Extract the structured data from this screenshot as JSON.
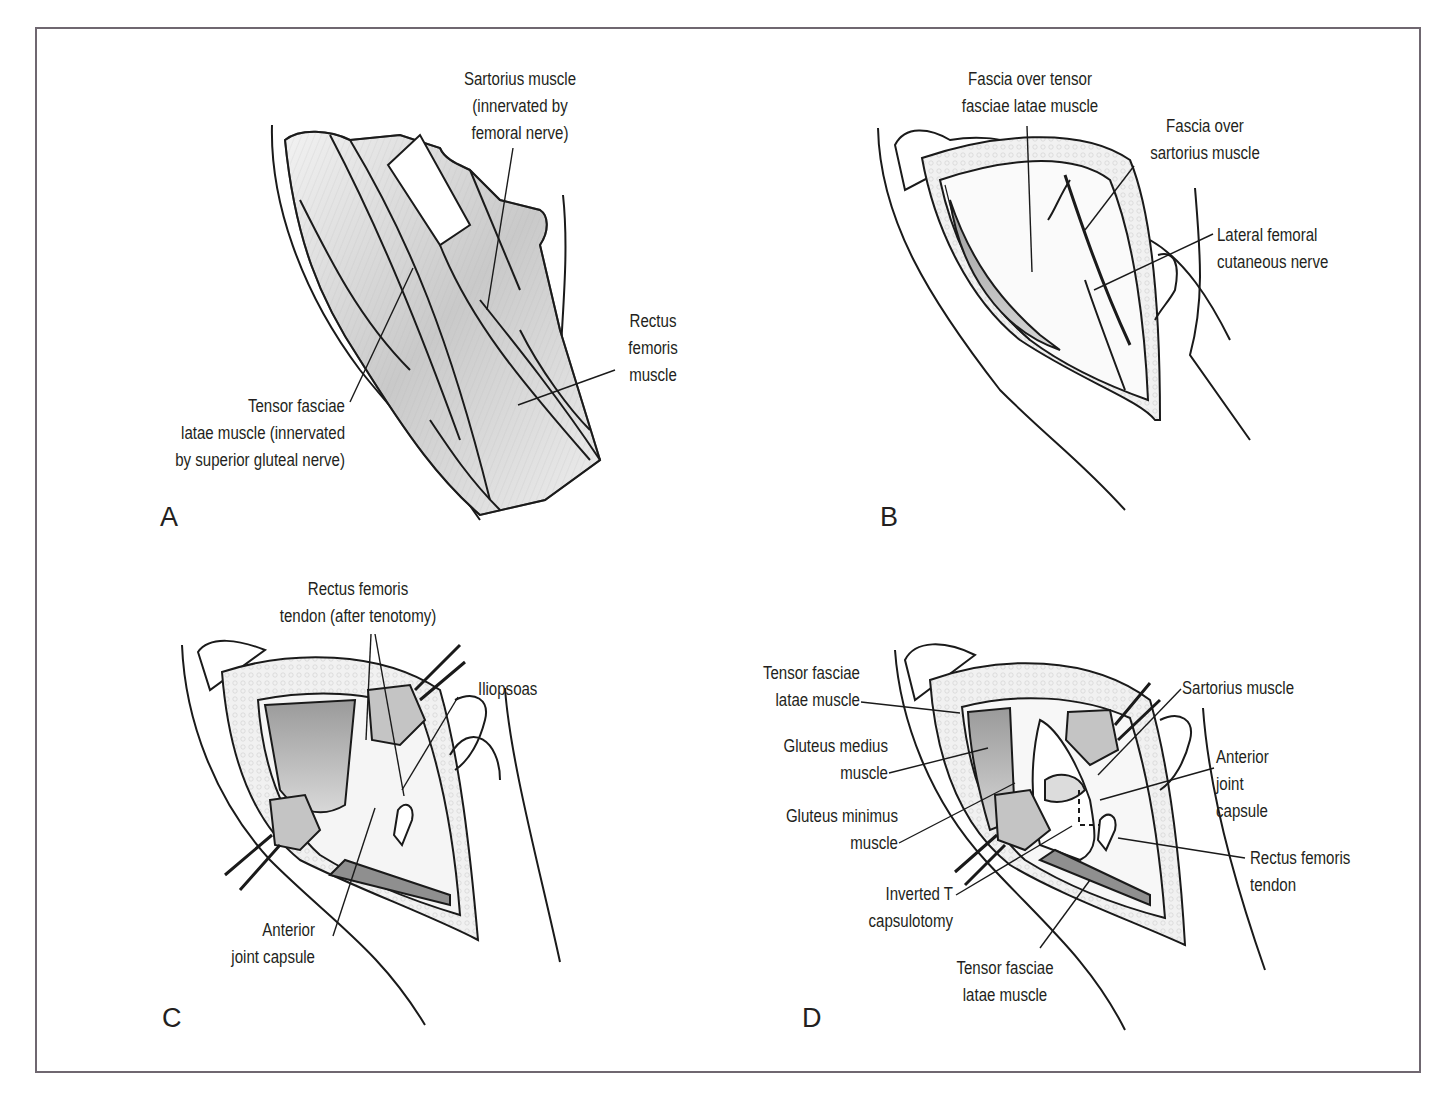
{
  "figure": {
    "panels": [
      {
        "id": "A",
        "label": "A",
        "callouts": [
          {
            "lines": [
              "Sartorius muscle",
              "(innervated by",
              "femoral nerve)"
            ]
          },
          {
            "lines": [
              "Rectus",
              "femoris",
              "muscle"
            ]
          },
          {
            "lines": [
              "Tensor fasciae",
              "latae muscle (innervated",
              "by superior gluteal nerve)"
            ]
          }
        ]
      },
      {
        "id": "B",
        "label": "B",
        "callouts": [
          {
            "lines": [
              "Fascia over tensor",
              "fasciae latae muscle"
            ]
          },
          {
            "lines": [
              "Fascia over",
              "sartorius muscle"
            ]
          },
          {
            "lines": [
              "Lateral femoral",
              "cutaneous nerve"
            ]
          }
        ]
      },
      {
        "id": "C",
        "label": "C",
        "callouts": [
          {
            "lines": [
              "Rectus femoris",
              "tendon (after tenotomy)"
            ]
          },
          {
            "lines": [
              "Iliopsoas"
            ]
          },
          {
            "lines": [
              "Anterior",
              "joint capsule"
            ]
          }
        ]
      },
      {
        "id": "D",
        "label": "D",
        "callouts": [
          {
            "lines": [
              "Tensor fasciae",
              "latae muscle"
            ]
          },
          {
            "lines": [
              "Gluteus medius",
              "muscle"
            ]
          },
          {
            "lines": [
              "Gluteus minimus",
              "muscle"
            ]
          },
          {
            "lines": [
              "Inverted T",
              "capsulotomy"
            ]
          },
          {
            "lines": [
              "Tensor fasciae",
              "latae muscle"
            ]
          },
          {
            "lines": [
              "Sartorius muscle"
            ]
          },
          {
            "lines": [
              "Anterior",
              "joint",
              "capsule"
            ]
          },
          {
            "lines": [
              "Rectus femoris",
              "tendon"
            ]
          }
        ]
      }
    ]
  }
}
